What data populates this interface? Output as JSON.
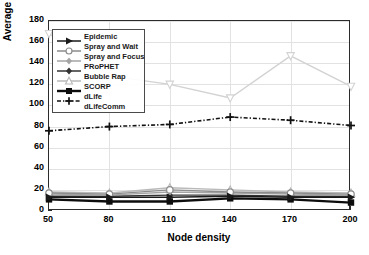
{
  "chart_data": {
    "type": "line",
    "title": "",
    "xlabel": "Node density",
    "ylabel": "Average Latency, min",
    "x": [
      50,
      80,
      110,
      140,
      170,
      200
    ],
    "xtick_labels": [
      "50",
      "80",
      "110",
      "140",
      "170",
      "200"
    ],
    "ytick_labels": [
      "0",
      "20",
      "40",
      "60",
      "80",
      "100",
      "120",
      "140",
      "160",
      "180"
    ],
    "yticks": [
      0,
      20,
      40,
      60,
      80,
      100,
      120,
      140,
      160,
      180
    ],
    "ylim": [
      0,
      180
    ],
    "xlim": [
      50,
      200
    ],
    "grid": true,
    "legend_position": "upper left",
    "series": [
      {
        "name": "Epidemic",
        "values": [
          13,
          13,
          13,
          14,
          13,
          13
        ],
        "color": "#1a1a1a",
        "marker": "triangle-right",
        "dash": "solid"
      },
      {
        "name": "Spray and Wait",
        "values": [
          17,
          16,
          20,
          18,
          17,
          16
        ],
        "color": "#8c8c8c",
        "marker": "circle",
        "dash": "solid"
      },
      {
        "name": "Spray and Focus",
        "values": [
          16,
          15,
          18,
          17,
          16,
          15
        ],
        "color": "#a5a5a5",
        "marker": "diamond",
        "dash": "solid"
      },
      {
        "name": "PRoPHET",
        "values": [
          14,
          14,
          15,
          15,
          14,
          14
        ],
        "color": "#333333",
        "marker": "diamond",
        "dash": "solid"
      },
      {
        "name": "Bubble Rap",
        "values": [
          18,
          17,
          22,
          20,
          18,
          17
        ],
        "color": "#b9b9b9",
        "marker": "triangle-up",
        "dash": "solid"
      },
      {
        "name": "SCORP",
        "values": [
          11,
          9,
          9,
          12,
          11,
          8
        ],
        "color": "#0d0d0d",
        "marker": "square",
        "dash": "solid"
      },
      {
        "name": "dLife",
        "values": [
          76,
          80,
          82,
          89,
          86,
          81
        ],
        "color": "#111111",
        "marker": "plus",
        "dash": "dashdot"
      },
      {
        "name": "dLifeComm",
        "values": [
          168,
          128,
          120,
          107,
          147,
          118
        ],
        "color": "#d2d2d2",
        "marker": "triangle-down",
        "dash": "solid"
      }
    ],
    "legend_entries": [
      "Epidemic",
      "Spray and Wait",
      "Spray and Focus",
      "PRoPHET",
      "Bubble Rap",
      "SCORP",
      "dLife",
      "dLifeComm"
    ]
  }
}
